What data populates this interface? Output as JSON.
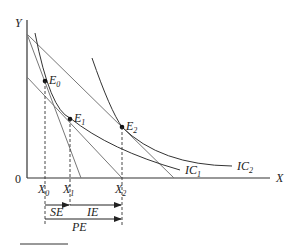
{
  "diagram": {
    "type": "indifference-curve-budget-line",
    "axes": {
      "y_label": "Y",
      "x_label": "X",
      "origin_label": "0"
    },
    "points": [
      {
        "name": "E",
        "sub": "0"
      },
      {
        "name": "E",
        "sub": "1"
      },
      {
        "name": "E",
        "sub": "2"
      }
    ],
    "curves": [
      {
        "name": "IC",
        "sub": "1"
      },
      {
        "name": "IC",
        "sub": "2"
      }
    ],
    "x_ticks": [
      {
        "name": "X",
        "sub": "0"
      },
      {
        "name": "X",
        "sub": "1"
      },
      {
        "name": "X",
        "sub": "2"
      }
    ],
    "effects": {
      "substitution": "SE",
      "income": "IE",
      "price": "PE"
    }
  },
  "colors": {
    "line": "#333333",
    "budget": "#666666"
  }
}
